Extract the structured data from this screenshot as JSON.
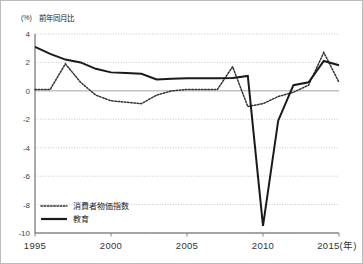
{
  "chart_data": {
    "type": "line",
    "title": "",
    "axis_note": "前年同月比",
    "unit_label": "(%)",
    "xlabel": "(年)",
    "ylabel": "",
    "xlim": [
      1995,
      2015
    ],
    "ylim": [
      -10,
      4
    ],
    "ytick_step": 2,
    "yticks": [
      "4",
      "2",
      "0",
      "-2",
      "-4",
      "-6",
      "-8",
      "-10"
    ],
    "ytick_values": [
      4,
      2,
      0,
      -2,
      -4,
      -6,
      -8,
      -10
    ],
    "xticks": [
      "1995",
      "2000",
      "2005",
      "2010",
      "2015"
    ],
    "xtick_values": [
      1995,
      2000,
      2005,
      2010,
      2015
    ],
    "xtick_suffix_label": "(年)",
    "grid": true,
    "grid_style": "dotted-horizontal",
    "legend_position": "bottom-left",
    "x": [
      1995,
      1996,
      1997,
      1998,
      1999,
      2000,
      2001,
      2002,
      2003,
      2004,
      2005,
      2006,
      2007,
      2008,
      2009,
      2010,
      2011,
      2012,
      2013,
      2014,
      2015
    ],
    "series": [
      {
        "name": "消費者物価指数",
        "style": "dotted",
        "color": "#333333",
        "values": [
          0.1,
          0.1,
          1.9,
          0.6,
          -0.3,
          -0.7,
          -0.8,
          -0.9,
          -0.3,
          0.0,
          0.1,
          0.1,
          0.1,
          1.7,
          -1.1,
          -0.9,
          -0.4,
          -0.1,
          0.4,
          2.7,
          0.6
        ]
      },
      {
        "name": "教育",
        "style": "solid",
        "color": "#1a1a1a",
        "values": [
          3.1,
          2.6,
          2.2,
          2.0,
          1.55,
          1.3,
          1.25,
          1.2,
          0.8,
          0.85,
          0.88,
          0.88,
          0.88,
          0.9,
          1.05,
          -9.5,
          -2.1,
          0.4,
          0.6,
          2.1,
          1.8
        ]
      }
    ],
    "legend": [
      {
        "label": "消費者物価指数",
        "style": "dotted"
      },
      {
        "label": "教育",
        "style": "solid"
      }
    ]
  },
  "geometry": {
    "plot_left": 34,
    "plot_right": 338,
    "plot_top": 33,
    "plot_bottom": 232
  }
}
